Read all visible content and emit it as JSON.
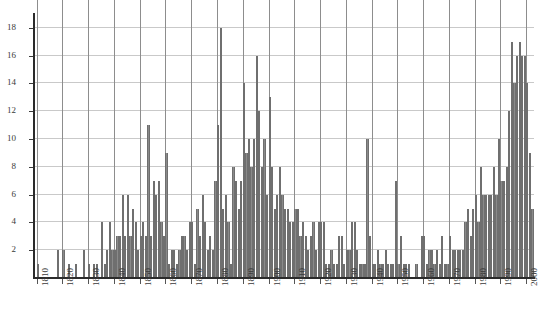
{
  "chart_data": {
    "type": "bar",
    "title": "",
    "subtitle": "",
    "xlabel": "",
    "ylabel": "",
    "xlim": [
      1809,
      2003
    ],
    "ylim": [
      0,
      19
    ],
    "grid": true,
    "legend": false,
    "legend_position": "none",
    "bar_color": "#8a8a8a",
    "axis_color": "#2b2b2b",
    "gridline_color": "#c9c9c9",
    "vertical_gridline_color": "#8d8d8d",
    "y_ticks": [
      2,
      4,
      6,
      8,
      10,
      12,
      14,
      16,
      18
    ],
    "x_ticks": [
      1810,
      1820,
      1830,
      1840,
      1850,
      1860,
      1870,
      1880,
      1890,
      1900,
      1910,
      1920,
      1930,
      1940,
      1950,
      1960,
      1970,
      1980,
      1990,
      2000
    ],
    "categories": [
      1810,
      1811,
      1812,
      1813,
      1814,
      1815,
      1816,
      1817,
      1818,
      1819,
      1820,
      1821,
      1822,
      1823,
      1824,
      1825,
      1826,
      1827,
      1828,
      1829,
      1830,
      1831,
      1832,
      1833,
      1834,
      1835,
      1836,
      1837,
      1838,
      1839,
      1840,
      1841,
      1842,
      1843,
      1844,
      1845,
      1846,
      1847,
      1848,
      1849,
      1850,
      1851,
      1852,
      1853,
      1854,
      1855,
      1856,
      1857,
      1858,
      1859,
      1860,
      1861,
      1862,
      1863,
      1864,
      1865,
      1866,
      1867,
      1868,
      1869,
      1870,
      1871,
      1872,
      1873,
      1874,
      1875,
      1876,
      1877,
      1878,
      1879,
      1880,
      1881,
      1882,
      1883,
      1884,
      1885,
      1886,
      1887,
      1888,
      1889,
      1890,
      1891,
      1892,
      1893,
      1894,
      1895,
      1896,
      1897,
      1898,
      1899,
      1900,
      1901,
      1902,
      1903,
      1904,
      1905,
      1906,
      1907,
      1908,
      1909,
      1910,
      1911,
      1912,
      1913,
      1914,
      1915,
      1916,
      1917,
      1918,
      1919,
      1920,
      1921,
      1922,
      1923,
      1924,
      1925,
      1926,
      1927,
      1928,
      1929,
      1930,
      1931,
      1932,
      1933,
      1934,
      1935,
      1936,
      1937,
      1938,
      1939,
      1940,
      1941,
      1942,
      1943,
      1944,
      1945,
      1946,
      1947,
      1948,
      1949,
      1950,
      1951,
      1952,
      1953,
      1954,
      1955,
      1956,
      1957,
      1958,
      1959,
      1960,
      1961,
      1962,
      1963,
      1964,
      1965,
      1966,
      1967,
      1968,
      1969,
      1970,
      1971,
      1972,
      1973,
      1974,
      1975,
      1976,
      1977,
      1978,
      1979,
      1980,
      1981,
      1982,
      1983,
      1984,
      1985,
      1986,
      1987,
      1988,
      1989,
      1990,
      1991,
      1992,
      1993,
      1994,
      1995,
      1996,
      1997,
      1998,
      1999,
      2000,
      2001,
      2002
    ],
    "values": [
      1,
      0,
      0,
      0,
      0,
      0,
      0,
      0,
      2,
      0,
      2,
      0,
      1,
      0,
      0,
      1,
      0,
      0,
      2,
      0,
      1,
      0,
      1,
      1,
      0,
      4,
      1,
      2,
      4,
      2,
      2,
      3,
      3,
      6,
      3,
      6,
      3,
      5,
      4,
      2,
      3,
      4,
      3,
      11,
      3,
      7,
      6,
      7,
      4,
      3,
      9,
      1,
      2,
      2,
      1,
      2,
      3,
      3,
      2,
      4,
      4,
      1,
      5,
      3,
      6,
      4,
      2,
      3,
      2,
      7,
      11,
      18,
      5,
      6,
      4,
      1,
      8,
      7,
      5,
      7,
      14,
      9,
      10,
      8,
      10,
      16,
      12,
      8,
      10,
      6,
      13,
      8,
      5,
      6,
      8,
      6,
      5,
      5,
      4,
      4,
      5,
      5,
      3,
      4,
      3,
      2,
      3,
      4,
      2,
      4,
      4,
      4,
      1,
      1,
      2,
      1,
      1,
      3,
      3,
      1,
      2,
      2,
      4,
      4,
      2,
      1,
      1,
      1,
      10,
      3,
      1,
      1,
      2,
      1,
      1,
      2,
      1,
      1,
      1,
      7,
      1,
      3,
      1,
      1,
      1,
      0,
      0,
      1,
      0,
      3,
      3,
      1,
      2,
      2,
      1,
      2,
      1,
      3,
      1,
      1,
      3,
      2,
      2,
      2,
      2,
      2,
      4,
      5,
      3,
      5,
      6,
      4,
      8,
      6,
      6,
      6,
      6,
      8,
      6,
      10,
      7,
      7,
      8,
      12,
      17,
      14,
      16,
      17,
      16,
      16,
      14,
      9,
      5
    ]
  }
}
